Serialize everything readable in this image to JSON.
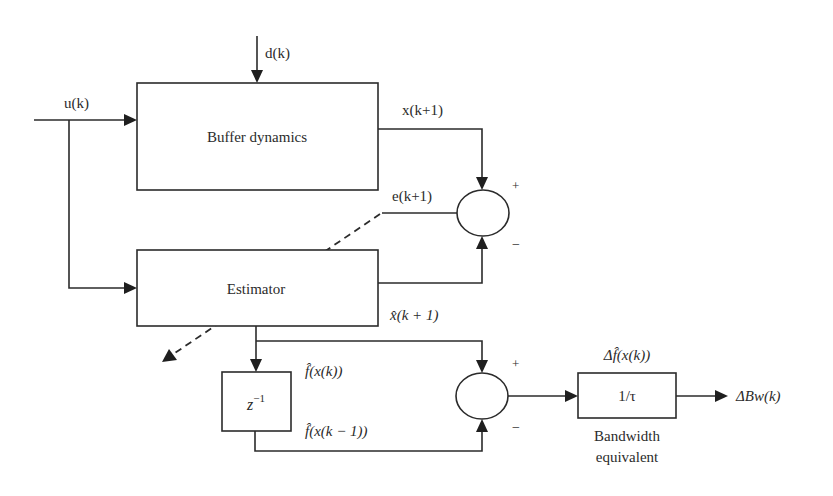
{
  "diagram": {
    "title": "",
    "blocks": {
      "buffer": {
        "label": "Buffer dynamics"
      },
      "estimator": {
        "label": "Estimator"
      },
      "delay": {
        "label_base": "z",
        "label_sup": "−1"
      },
      "bandwidth": {
        "label": "1/τ",
        "caption_line1": "Bandwidth",
        "caption_line2": "equivalent"
      }
    },
    "signals": {
      "input": "u(k)",
      "disturbance": "d(k)",
      "state_next": "x(k+1)",
      "error": "e(k+1)",
      "estimate_next": "x̂(k + 1)",
      "f_hat_k": "f̂(x(k))",
      "f_hat_k_minus_1": "f̂(x(k − 1))",
      "delta_f_hat": "Δf̂(x(k))",
      "output": "ΔBw(k)"
    },
    "summing_junctions": {
      "error_junction": {
        "plus": "+",
        "minus": "−"
      },
      "difference_junction": {
        "plus": "+",
        "minus": "−"
      }
    },
    "colors": {
      "stroke": "#2b2b2b",
      "background": "#ffffff"
    }
  }
}
